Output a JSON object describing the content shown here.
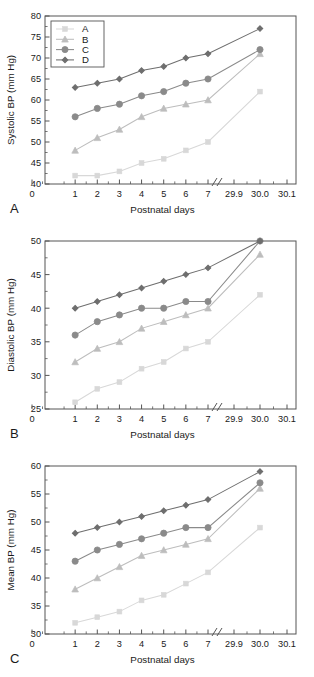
{
  "figure": {
    "panels": [
      {
        "letter": "A",
        "ylabel": "Systolic BP (mm Hg)",
        "xlabel": "Postnatal days"
      },
      {
        "letter": "B",
        "ylabel": "Diastolic BP (mm Hg)",
        "xlabel": "Postnatal days"
      },
      {
        "letter": "C",
        "ylabel": "Mean BP (mm Hg)",
        "xlabel": "Postnatal days"
      }
    ],
    "legend": {
      "position": "top-left",
      "entries": [
        {
          "label": "A",
          "marker": "square",
          "color": "#d8d8d8"
        },
        {
          "label": "B",
          "marker": "triangle",
          "color": "#bdbdbd"
        },
        {
          "label": "C",
          "marker": "circle",
          "color": "#8a8a8a"
        },
        {
          "label": "D",
          "marker": "diamond",
          "color": "#6e6e6e"
        }
      ]
    }
  },
  "chart_data": [
    {
      "type": "line",
      "title": "A",
      "xlabel": "Postnatal days",
      "ylabel": "Systolic BP (mm Hg)",
      "ylim": [
        40,
        80
      ],
      "yticks": [
        40,
        45,
        50,
        55,
        60,
        65,
        70,
        75,
        80
      ],
      "xticks": [
        0,
        1,
        2,
        3,
        4,
        5,
        6,
        7,
        29.9,
        30.0,
        30.1
      ],
      "xtick_labels": [
        "0",
        "1",
        "2",
        "3",
        "4",
        "5",
        "6",
        "7",
        "29.9",
        "30.0",
        "30.1"
      ],
      "axis_break": true,
      "grid": false,
      "x": [
        1,
        2,
        3,
        4,
        5,
        6,
        7,
        30.0
      ],
      "series": [
        {
          "name": "A",
          "marker": "square",
          "color": "#d8d8d8",
          "values": [
            42,
            42,
            43,
            45,
            46,
            48,
            50,
            62
          ]
        },
        {
          "name": "B",
          "marker": "triangle",
          "color": "#bdbdbd",
          "values": [
            48,
            51,
            53,
            56,
            58,
            59,
            60,
            71
          ]
        },
        {
          "name": "C",
          "marker": "circle",
          "color": "#8a8a8a",
          "values": [
            56,
            58,
            59,
            61,
            62,
            64,
            65,
            72
          ]
        },
        {
          "name": "D",
          "marker": "diamond",
          "color": "#6e6e6e",
          "values": [
            63,
            64,
            65,
            67,
            68,
            70,
            71,
            77
          ]
        }
      ]
    },
    {
      "type": "line",
      "title": "B",
      "xlabel": "Postnatal days",
      "ylabel": "Diastolic BP (mm Hg)",
      "ylim": [
        25,
        50
      ],
      "yticks": [
        25,
        30,
        35,
        40,
        45,
        50
      ],
      "xticks": [
        0,
        1,
        2,
        3,
        4,
        5,
        6,
        7,
        29.9,
        30.0,
        30.1
      ],
      "xtick_labels": [
        "0",
        "1",
        "2",
        "3",
        "4",
        "5",
        "6",
        "7",
        "29.9",
        "30.0",
        "30.1"
      ],
      "axis_break": true,
      "grid": false,
      "x": [
        1,
        2,
        3,
        4,
        5,
        6,
        7,
        30.0
      ],
      "series": [
        {
          "name": "A",
          "marker": "square",
          "color": "#d8d8d8",
          "values": [
            26,
            28,
            29,
            31,
            32,
            34,
            35,
            42
          ]
        },
        {
          "name": "B",
          "marker": "triangle",
          "color": "#bdbdbd",
          "values": [
            32,
            34,
            35,
            37,
            38,
            39,
            40,
            48
          ]
        },
        {
          "name": "C",
          "marker": "circle",
          "color": "#8a8a8a",
          "values": [
            36,
            38,
            39,
            40,
            40,
            41,
            41,
            50
          ]
        },
        {
          "name": "D",
          "marker": "diamond",
          "color": "#6e6e6e",
          "values": [
            40,
            41,
            42,
            43,
            44,
            45,
            46,
            50
          ]
        }
      ]
    },
    {
      "type": "line",
      "title": "C",
      "xlabel": "Postnatal days",
      "ylabel": "Mean BP (mm Hg)",
      "ylim": [
        30,
        60
      ],
      "yticks": [
        30,
        35,
        40,
        45,
        50,
        55,
        60
      ],
      "xticks": [
        0,
        1,
        2,
        3,
        4,
        5,
        6,
        7,
        29.9,
        30.0,
        30.1
      ],
      "xtick_labels": [
        "0",
        "1",
        "2",
        "3",
        "4",
        "5",
        "6",
        "7",
        "29.9",
        "30.0",
        "30.1"
      ],
      "axis_break": true,
      "grid": false,
      "x": [
        1,
        2,
        3,
        4,
        5,
        6,
        7,
        30.0
      ],
      "series": [
        {
          "name": "A",
          "marker": "square",
          "color": "#d8d8d8",
          "values": [
            32,
            33,
            34,
            36,
            37,
            39,
            41,
            49
          ]
        },
        {
          "name": "B",
          "marker": "triangle",
          "color": "#bdbdbd",
          "values": [
            38,
            40,
            42,
            44,
            45,
            46,
            47,
            56
          ]
        },
        {
          "name": "C",
          "marker": "circle",
          "color": "#8a8a8a",
          "values": [
            43,
            45,
            46,
            47,
            48,
            49,
            49,
            57
          ]
        },
        {
          "name": "D",
          "marker": "diamond",
          "color": "#6e6e6e",
          "values": [
            48,
            49,
            50,
            51,
            52,
            53,
            54,
            59
          ]
        }
      ]
    }
  ]
}
